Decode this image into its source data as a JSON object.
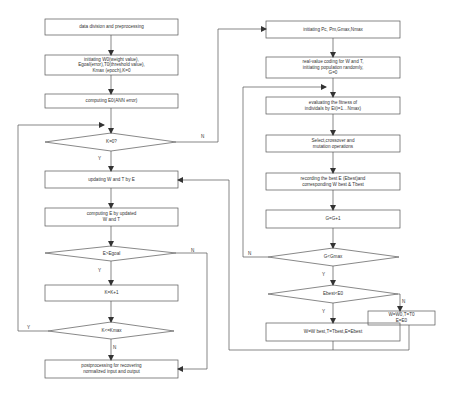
{
  "diagram": {
    "left_flow": {
      "nodes": [
        {
          "id": "data-division",
          "type": "process",
          "label": "data division and preprocessing"
        },
        {
          "id": "init-ann",
          "type": "process",
          "label": "initiating W0(weight value),\nEgoal(error),T0(threshold value),\nKmax (epoch),K=0"
        },
        {
          "id": "compute-e0",
          "type": "process",
          "label": "computing E0(ANN error)"
        },
        {
          "id": "k-zero",
          "type": "decision",
          "label": "K=0?"
        },
        {
          "id": "update-wt",
          "type": "process",
          "label": "updating W and T by E"
        },
        {
          "id": "compute-e",
          "type": "process",
          "label": "computing E by updated\nW and T"
        },
        {
          "id": "e-gt-egoal",
          "type": "decision",
          "label": "E>Egoal"
        },
        {
          "id": "k-inc",
          "type": "process",
          "label": "K=K+1"
        },
        {
          "id": "k-le-kmax",
          "type": "decision",
          "label": "K<=Kmax"
        },
        {
          "id": "postprocess",
          "type": "process",
          "label": "postprocessing for recovering\nnormalized input and output"
        }
      ]
    },
    "right_flow": {
      "nodes": [
        {
          "id": "init-ga",
          "type": "process",
          "label": "initiating  Pc, Pm,Gmax,Nmax"
        },
        {
          "id": "coding",
          "type": "process",
          "label": "real-value coding for W and T,\ninitiating population randomly,\nG=0"
        },
        {
          "id": "evaluate",
          "type": "process",
          "label": "evaluating the fitness of\nindividals by Ei(i=1…Nmax)"
        },
        {
          "id": "select",
          "type": "process",
          "label": "Select,crossover and\nmutation operations"
        },
        {
          "id": "record-best",
          "type": "process",
          "label": "recording the best E (Ebest)and\ncorresponding W best & Tbest"
        },
        {
          "id": "g-inc",
          "type": "process",
          "label": "G=G+1"
        },
        {
          "id": "g-lt-gmax",
          "type": "decision",
          "label": "G<Gmax"
        },
        {
          "id": "ebest-lt-e0",
          "type": "decision",
          "label": "Ebest<E0"
        },
        {
          "id": "reset-w0",
          "type": "process",
          "label": "W=W0,T=T0\nE=E0"
        },
        {
          "id": "set-best",
          "type": "process",
          "label": "W=W best,T=Tbest,E=Ebest"
        }
      ]
    },
    "edge_labels": {
      "k_zero_no": "N",
      "k_zero_yes": "Y",
      "egoal_yes": "Y",
      "egoal_no": "N",
      "kmax_yes": "Y",
      "kmax_no": "N",
      "gmax_no": "N",
      "gmax_yes": "Y",
      "ebest_yes": "Y",
      "ebest_no": "N"
    },
    "colors": {
      "stroke": "#555555",
      "text": "#333333",
      "background": "#ffffff"
    }
  }
}
